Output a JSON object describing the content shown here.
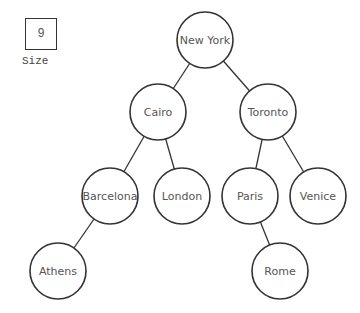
{
  "size_widget": {
    "value": "9",
    "label": "Size"
  },
  "tree": {
    "radius": 28,
    "nodes": [
      {
        "id": "newyork",
        "label": "New York",
        "x": 205,
        "y": 40
      },
      {
        "id": "cairo",
        "label": "Cairo",
        "x": 158,
        "y": 112
      },
      {
        "id": "toronto",
        "label": "Toronto",
        "x": 268,
        "y": 112
      },
      {
        "id": "barcelona",
        "label": "Barcelona",
        "x": 110,
        "y": 196
      },
      {
        "id": "london",
        "label": "London",
        "x": 182,
        "y": 196
      },
      {
        "id": "paris",
        "label": "Paris",
        "x": 250,
        "y": 196
      },
      {
        "id": "venice",
        "label": "Venice",
        "x": 318,
        "y": 196
      },
      {
        "id": "athens",
        "label": "Athens",
        "x": 58,
        "y": 271
      },
      {
        "id": "rome",
        "label": "Rome",
        "x": 280,
        "y": 271
      }
    ],
    "edges": [
      [
        "newyork",
        "cairo"
      ],
      [
        "newyork",
        "toronto"
      ],
      [
        "cairo",
        "barcelona"
      ],
      [
        "cairo",
        "london"
      ],
      [
        "toronto",
        "paris"
      ],
      [
        "toronto",
        "venice"
      ],
      [
        "barcelona",
        "athens"
      ],
      [
        "paris",
        "rome"
      ]
    ]
  }
}
